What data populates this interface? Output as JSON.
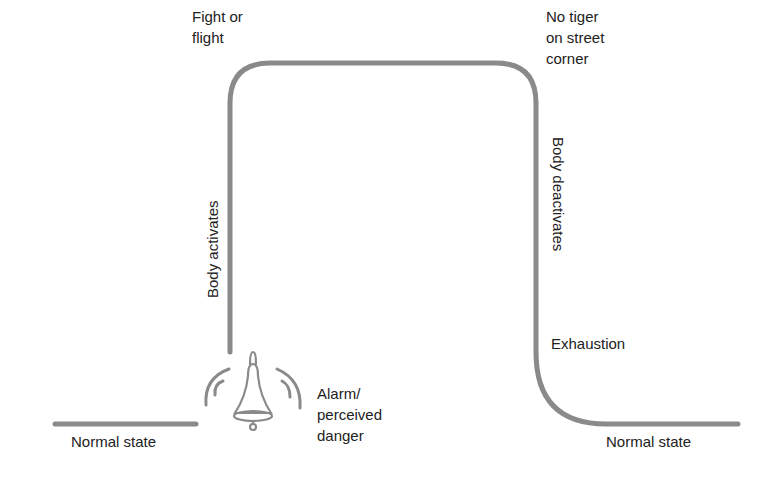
{
  "diagram": {
    "type": "stress-response-curve",
    "colors": {
      "line": "#8a8a8a",
      "text": "#222222",
      "background": "#ffffff"
    },
    "labels": {
      "fight_or_flight": [
        "Fight or",
        "flight"
      ],
      "no_tiger": [
        "No tiger",
        "on street",
        "corner"
      ],
      "body_activates": "Body activates",
      "body_deactivates": "Body deactivates",
      "exhaustion": "Exhaustion",
      "alarm": [
        "Alarm/",
        "perceived",
        "danger"
      ],
      "normal_state_left": "Normal state",
      "normal_state_right": "Normal state"
    },
    "icons": {
      "alarm": "bell-icon"
    }
  }
}
